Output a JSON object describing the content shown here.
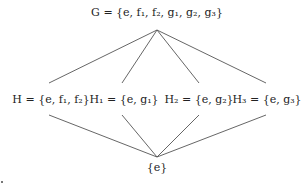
{
  "diagram": {
    "type": "subgroup-lattice",
    "edge_color": "#555555",
    "nodes": {
      "top": {
        "id": "G",
        "name": "G",
        "eq": "=",
        "elements_text": "{e, f₁, f₂, g₁, g₂, g₃}",
        "x": 157,
        "y": 20
      },
      "H": {
        "id": "H",
        "name": "H",
        "eq": "=",
        "elements_text": "{e, f₁, f₂}",
        "x": 51,
        "y": 100
      },
      "H1": {
        "id": "H1",
        "name": "H₁",
        "eq": "=",
        "elements_text": "{e, g₁}",
        "x": 124,
        "y": 100
      },
      "H2": {
        "id": "H2",
        "name": "H₂",
        "eq": "=",
        "elements_text": "{e, g₂}",
        "x": 199,
        "y": 100
      },
      "H3": {
        "id": "H3",
        "name": "H₃",
        "eq": "=",
        "elements_text": "{e, g₃}",
        "x": 267,
        "y": 100
      },
      "bottom": {
        "id": "trivial",
        "elements_text": "{e}",
        "x": 157,
        "y": 168
      }
    },
    "edges": [
      {
        "from": "G",
        "to": "H",
        "x1": 157,
        "y1": 30,
        "x2": 49,
        "y2": 83
      },
      {
        "from": "G",
        "to": "H1",
        "x1": 157,
        "y1": 30,
        "x2": 122,
        "y2": 83
      },
      {
        "from": "G",
        "to": "H2",
        "x1": 157,
        "y1": 30,
        "x2": 199,
        "y2": 83
      },
      {
        "from": "G",
        "to": "H3",
        "x1": 157,
        "y1": 30,
        "x2": 266,
        "y2": 83
      },
      {
        "from": "H",
        "to": "trivial",
        "x1": 49,
        "y1": 115,
        "x2": 157,
        "y2": 157
      },
      {
        "from": "H1",
        "to": "trivial",
        "x1": 122,
        "y1": 115,
        "x2": 157,
        "y2": 157
      },
      {
        "from": "H2",
        "to": "trivial",
        "x1": 199,
        "y1": 115,
        "x2": 157,
        "y2": 157
      },
      {
        "from": "H3",
        "to": "trivial",
        "x1": 266,
        "y1": 115,
        "x2": 157,
        "y2": 157
      }
    ]
  }
}
